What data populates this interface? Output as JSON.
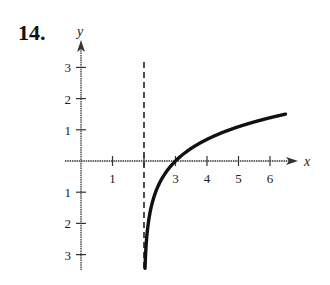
{
  "problem_number": "14.",
  "chart_data": {
    "type": "line",
    "title": "",
    "xlabel": "x",
    "ylabel": "y",
    "xlim": [
      -0.3,
      6.8
    ],
    "ylim": [
      -3.5,
      3.6
    ],
    "x_ticks": [
      1,
      2,
      3,
      4,
      5,
      6
    ],
    "x_tick_labels": [
      "1",
      "",
      "3",
      "4",
      "5",
      "6"
    ],
    "y_ticks": [
      -3,
      -2,
      -1,
      1,
      2,
      3
    ],
    "y_tick_labels": [
      "3",
      "2",
      "1",
      "1",
      "2",
      "3"
    ],
    "grid": false,
    "asymptote": {
      "type": "vertical",
      "x": 2,
      "style": "dashed"
    },
    "series": [
      {
        "name": "f(x) = ln(x - 2)",
        "x": [
          2.03,
          2.1,
          2.25,
          2.5,
          3,
          3.5,
          4,
          4.5,
          5,
          5.5,
          6,
          6.5
        ],
        "values": [
          -3.5,
          -2.3,
          -1.39,
          -0.69,
          0,
          0.41,
          0.69,
          0.92,
          1.1,
          1.25,
          1.39,
          1.5
        ]
      }
    ]
  }
}
